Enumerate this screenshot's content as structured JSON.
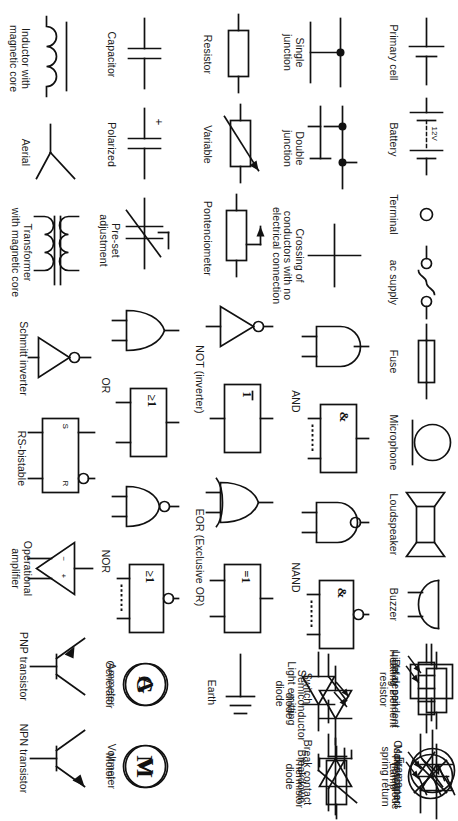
{
  "document": {
    "kind": "circuit-symbols-reference-sheet",
    "orientation_note": "page rotated 90 degrees clockwise in screenshot",
    "background_color": "#ffffff",
    "ink_color": "#111111"
  },
  "rows": [
    {
      "id": "row-1",
      "items": [
        {
          "id": "primary-cell",
          "label": "Primary cell",
          "symbol": "battery-cell-icon"
        },
        {
          "id": "battery",
          "label": "Battery",
          "symbol": "battery-icon",
          "value_text": "12V"
        },
        {
          "id": "terminal",
          "label": "Terminal",
          "symbol": "terminal-icon"
        },
        {
          "id": "ac-supply",
          "label": "ac supply",
          "symbol": "ac-supply-icon"
        },
        {
          "id": "fuse",
          "label": "Fuse",
          "symbol": "fuse-icon"
        },
        {
          "id": "microphone",
          "label": "Microphone",
          "symbol": "microphone-icon"
        },
        {
          "id": "loudspeaker",
          "label": "Loudspeaker",
          "symbol": "loudspeaker-icon"
        },
        {
          "id": "buzzer",
          "label": "Buzzer",
          "symbol": "buzzer-icon"
        },
        {
          "id": "heating-element",
          "label": "Heating element",
          "symbol": "heating-element-icon"
        },
        {
          "id": "lamp",
          "label": "Lamp",
          "symbol": "lamp-icon"
        },
        {
          "id": "ldr",
          "label": "Light dependent\nresistor",
          "symbol": "light-dependent-resistor-icon"
        },
        {
          "id": "photodiode",
          "label": "Photodiode",
          "symbol": "photodiode-icon"
        },
        {
          "id": "thermistor",
          "label": "Thermistor",
          "symbol": "thermistor-icon"
        }
      ]
    },
    {
      "id": "row-2",
      "items": [
        {
          "id": "single-junction",
          "label": "Single\njunction",
          "symbol": "single-junction-icon"
        },
        {
          "id": "double-junction",
          "label": "Double\njunction",
          "symbol": "double-junction-icon"
        },
        {
          "id": "crossing",
          "label": "Crossing of\nconductors with no\nelectrical connection",
          "symbol": "conductor-crossing-icon"
        },
        {
          "id": "and-gate",
          "label": "AND",
          "symbol": "and-gate-icon",
          "box_glyph": "&"
        },
        {
          "id": "nand-gate",
          "label": "NAND",
          "symbol": "nand-gate-icon",
          "box_glyph": "&"
        },
        {
          "id": "semiconductor-diode",
          "label": "Semiconductor\ndiode",
          "symbol": "diode-icon"
        },
        {
          "id": "led",
          "label": "Light emitting\ndiode",
          "symbol": "led-icon"
        },
        {
          "id": "breakdown-diode",
          "label": "Breakdown\ndiode",
          "symbol": "zener-diode-icon"
        }
      ]
    },
    {
      "id": "row-3",
      "items": [
        {
          "id": "resistor",
          "label": "Resistor",
          "symbol": "resistor-icon"
        },
        {
          "id": "variable-resistor",
          "label": "Variable",
          "symbol": "variable-resistor-icon"
        },
        {
          "id": "potentiometer",
          "label": "Pontenciometer",
          "symbol": "potentiometer-icon"
        },
        {
          "id": "not-gate",
          "label": "NOT (inverter)",
          "symbol": "not-gate-icon",
          "box_glyph": "1"
        },
        {
          "id": "eor-gate",
          "label": "EOR (Exclusive OR)",
          "symbol": "eor-gate-icon",
          "box_glyph": "=1"
        },
        {
          "id": "switch",
          "label": "Switch",
          "symbol": "switch-icon"
        },
        {
          "id": "break-contact",
          "label": "Break contact",
          "symbol": "break-contact-icon"
        },
        {
          "id": "relay-coil",
          "label": "Relay coil",
          "symbol": "relay-coil-icon"
        },
        {
          "id": "make-contact",
          "label": "Make contact\nspring return",
          "symbol": "make-contact-icon"
        }
      ]
    },
    {
      "id": "row-4",
      "items": [
        {
          "id": "capacitor",
          "label": "Capacitor",
          "symbol": "capacitor-icon"
        },
        {
          "id": "polarized-capacitor",
          "label": "Polarized",
          "symbol": "polarized-capacitor-icon",
          "value_text": "+"
        },
        {
          "id": "preset-adjustment",
          "label": "Pre-set\nadjustment",
          "symbol": "preset-adjustment-icon"
        },
        {
          "id": "or-gate",
          "label": "OR",
          "symbol": "or-gate-icon",
          "box_glyph": "≥1"
        },
        {
          "id": "nor-gate",
          "label": "NOR",
          "symbol": "nor-gate-icon",
          "box_glyph": "≥1"
        },
        {
          "id": "earth",
          "label": "Earth",
          "symbol": "earth-icon"
        },
        {
          "id": "generator",
          "label": "Generator",
          "symbol": "generator-icon",
          "glyph": "G"
        },
        {
          "id": "motor",
          "label": "Motor",
          "symbol": "motor-icon",
          "glyph": "M"
        },
        {
          "id": "frame",
          "label": "Frame",
          "symbol": "frame-icon"
        }
      ]
    },
    {
      "id": "row-5",
      "items": [
        {
          "id": "inductor",
          "label": "Inductor with\nmagnetic core",
          "symbol": "inductor-icon"
        },
        {
          "id": "aerial",
          "label": "Aerial",
          "symbol": "aerial-icon"
        },
        {
          "id": "transformer",
          "label": "Transformer\nwith magnetic core",
          "symbol": "transformer-icon"
        },
        {
          "id": "schmitt-inverter",
          "label": "Schmitt inverter",
          "symbol": "schmitt-inverter-icon"
        },
        {
          "id": "rs-bistable",
          "label": "RS-bistable",
          "symbol": "rs-bistable-icon",
          "pin_s": "S",
          "pin_r": "R"
        },
        {
          "id": "operational-amplifier",
          "label": "Operational\namplifier",
          "symbol": "op-amp-icon",
          "pin_minus": "−",
          "pin_plus": "+"
        },
        {
          "id": "pnp-transistor",
          "label": "PNP transistor",
          "symbol": "pnp-transistor-icon"
        },
        {
          "id": "npn-transistor",
          "label": "NPN transistor",
          "symbol": "npn-transistor-icon"
        },
        {
          "id": "ammeter",
          "label": "Ammeter",
          "symbol": "ammeter-icon",
          "glyph": "A"
        },
        {
          "id": "voltmeter",
          "label": "Voltmeter",
          "symbol": "voltmeter-icon",
          "glyph": "V"
        },
        {
          "id": "oscilloscope",
          "label": "Oscilloscope",
          "symbol": "oscilloscope-icon"
        }
      ]
    }
  ]
}
